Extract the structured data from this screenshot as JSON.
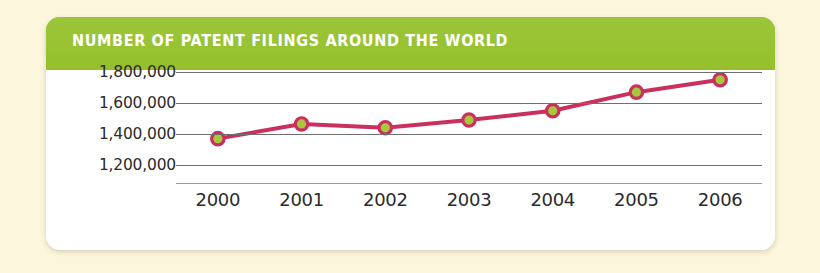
{
  "card": {
    "title": "NUMBER OF PATENT FILINGS AROUND THE WORLD"
  },
  "colors": {
    "page_background": "#fbf6dc",
    "card_background": "#ffffff",
    "header_green": "#97c22f",
    "title_text": "#ffffff",
    "line_crimson": "#c9305e",
    "marker_fill_green": "#a8c73c",
    "gridline_gray": "#6f6f6f",
    "axis_text": "#2b2b2b"
  },
  "chart_data": {
    "type": "line",
    "title": "NUMBER OF PATENT FILINGS AROUND THE WORLD",
    "xlabel": "",
    "ylabel": "",
    "categories": [
      "2000",
      "2001",
      "2002",
      "2003",
      "2004",
      "2005",
      "2006"
    ],
    "x_tick_labels": [
      "2000",
      "2001",
      "2002",
      "2003",
      "2004",
      "2005",
      "2006"
    ],
    "y_tick_labels": [
      "1,800,000",
      "1,600,000",
      "1,400,000",
      "1,200,000"
    ],
    "y_tick_values": [
      1800000,
      1600000,
      1400000,
      1200000
    ],
    "ylim": [
      1200000,
      1800000
    ],
    "grid": true,
    "grid_axis": "y",
    "legend": false,
    "legend_position": "none",
    "series": [
      {
        "name": "Patent filings",
        "values": [
          1370000,
          1465000,
          1440000,
          1490000,
          1550000,
          1670000,
          1750000
        ],
        "line_color": "#c9305e",
        "marker_color": "#a8c73c",
        "marker_edge_color": "#c9305e"
      }
    ]
  }
}
